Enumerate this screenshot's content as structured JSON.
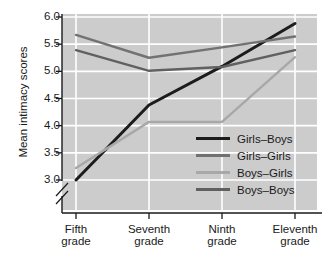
{
  "chart_data": {
    "type": "line",
    "title": "",
    "xlabel": "",
    "ylabel": "Mean intimacy scores",
    "categories": [
      "Fifth grade",
      "Seventh grade",
      "Ninth grade",
      "Eleventh grade"
    ],
    "category_lines": [
      [
        "Fifth",
        "grade"
      ],
      [
        "Seventh",
        "grade"
      ],
      [
        "Ninth",
        "grade"
      ],
      [
        "Eleventh",
        "grade"
      ]
    ],
    "yticks": [
      "3.0",
      "3.5",
      "4.0",
      "4.5",
      "5.0",
      "5.5",
      "6.0"
    ],
    "ytick_values": [
      3.0,
      3.5,
      4.0,
      4.5,
      5.0,
      5.5,
      6.0
    ],
    "ylim": [
      3.0,
      6.0
    ],
    "y_axis_break": true,
    "grid": true,
    "grid_color": "#ffffff",
    "plot_background": "#cccccc",
    "legend_position": "inside-lower-right",
    "series": [
      {
        "name": "Girls–Boys",
        "color": "#1c1c1c",
        "width": 3.0,
        "values": [
          3.0,
          4.38,
          5.09,
          5.88
        ]
      },
      {
        "name": "Girls–Girls",
        "color": "#727272",
        "width": 2.4,
        "values": [
          5.67,
          5.25,
          5.44,
          5.64
        ]
      },
      {
        "name": "Boys–Girls",
        "color": "#a8a8a8",
        "width": 2.4,
        "values": [
          3.22,
          4.07,
          4.07,
          5.26
        ]
      },
      {
        "name": "Boys–Boys",
        "color": "#606060",
        "width": 2.4,
        "values": [
          5.39,
          5.01,
          5.08,
          5.39
        ]
      }
    ]
  },
  "legend": {
    "items": [
      {
        "label": "Girls–Boys",
        "color": "#1c1c1c"
      },
      {
        "label": "Girls–Girls",
        "color": "#727272"
      },
      {
        "label": "Boys–Girls",
        "color": "#a8a8a8"
      },
      {
        "label": "Boys–Boys",
        "color": "#606060"
      }
    ]
  }
}
